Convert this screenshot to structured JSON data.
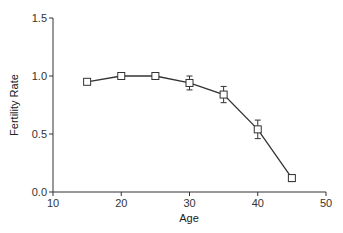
{
  "chart_data": {
    "type": "line",
    "title": "",
    "xlabel": "Age",
    "ylabel": "Fertility Rate",
    "xlim": [
      10,
      50
    ],
    "ylim": [
      0.0,
      1.5
    ],
    "xticks": [
      "10",
      "20",
      "30",
      "40",
      "50"
    ],
    "yticks": [
      "0.0",
      "0.5",
      "1.0",
      "1.5"
    ],
    "grid": false,
    "legend": null,
    "series": [
      {
        "name": "Fertility Rate",
        "marker": "open-square",
        "x": [
          15,
          20,
          25,
          30,
          35,
          40,
          45
        ],
        "values": [
          0.95,
          1.0,
          1.0,
          0.94,
          0.84,
          0.54,
          0.12
        ],
        "error": [
          0.01,
          0.01,
          0.03,
          0.06,
          0.07,
          0.08,
          0.03
        ]
      }
    ]
  },
  "colors": {
    "line": "#333333",
    "marker_fill": "#ffffff"
  }
}
